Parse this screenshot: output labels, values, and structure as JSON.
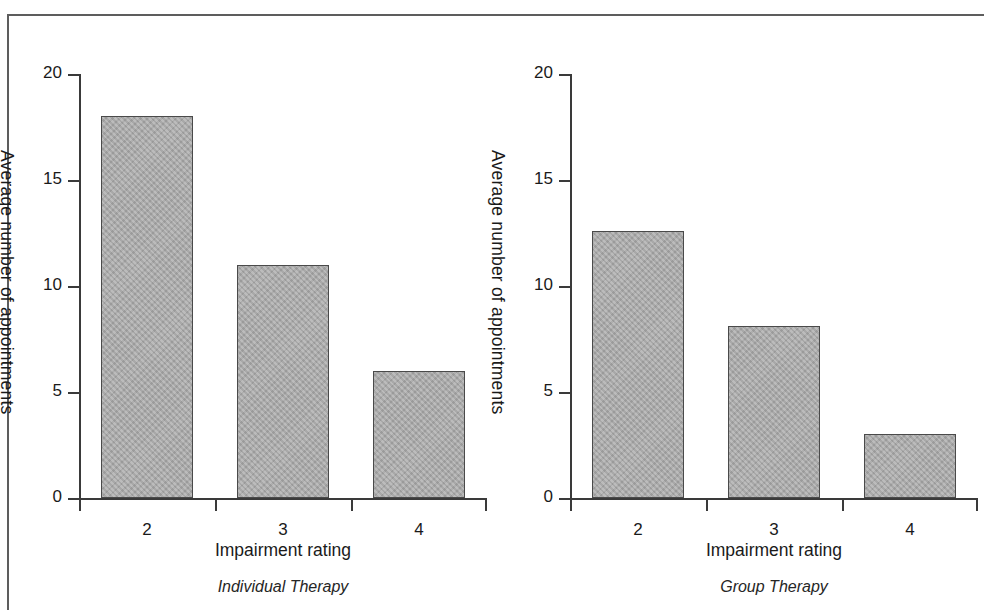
{
  "figure": {
    "frame_color": "#5d5d5d",
    "background": "#ffffff"
  },
  "chart_data": [
    {
      "type": "bar",
      "title": "Individual Therapy",
      "caption": "Individual Therapy",
      "xlabel": "Impairment rating",
      "ylabel": "Average number of appointments",
      "categories": [
        "2",
        "3",
        "4"
      ],
      "values": [
        18,
        11,
        6
      ],
      "ylim": [
        0,
        20
      ],
      "yticks": [
        0,
        5,
        10,
        15,
        20
      ],
      "ytick_labels": [
        "0",
        "5",
        "10",
        "15",
        "20"
      ],
      "grid": false,
      "legend": null,
      "bar_color": "#a9a9a9",
      "bar_edge_color": "#4a4a4a"
    },
    {
      "type": "bar",
      "title": "Group Therapy",
      "caption": "Group Therapy",
      "xlabel": "Impairment rating",
      "ylabel": "Average number of appointments",
      "categories": [
        "2",
        "3",
        "4"
      ],
      "values": [
        12.6,
        8.1,
        3
      ],
      "ylim": [
        0,
        20
      ],
      "yticks": [
        0,
        5,
        10,
        15,
        20
      ],
      "ytick_labels": [
        "0",
        "5",
        "10",
        "15",
        "20"
      ],
      "grid": false,
      "legend": null,
      "bar_color": "#a9a9a9",
      "bar_edge_color": "#4a4a4a"
    }
  ]
}
